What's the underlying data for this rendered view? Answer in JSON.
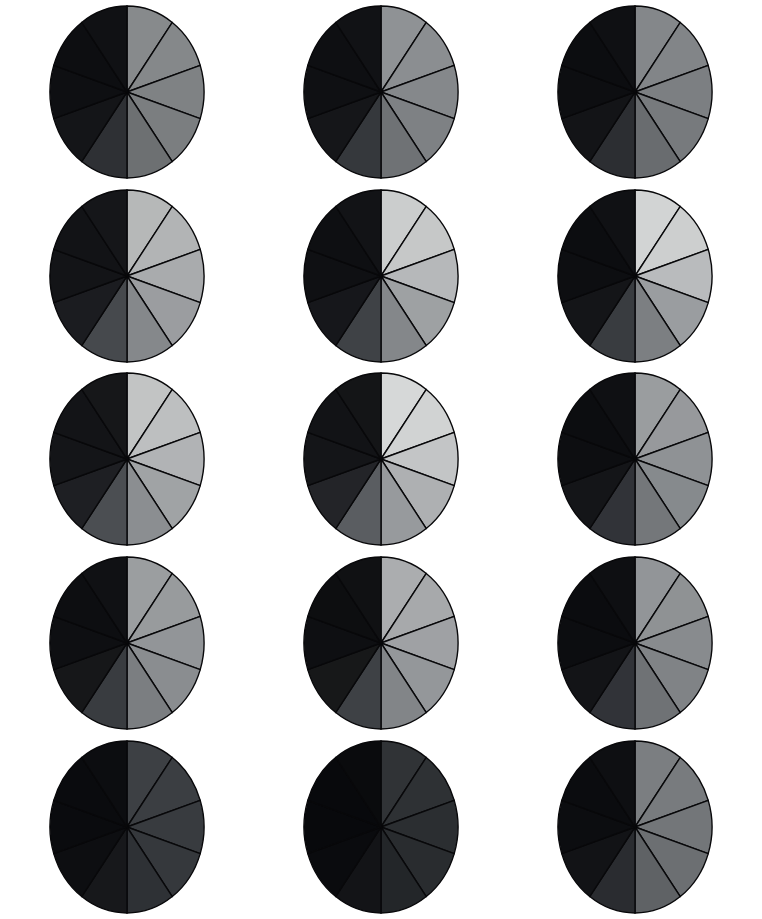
{
  "figure": {
    "title": "",
    "background_color": "#ffffff",
    "width": 762,
    "height": 919,
    "rows": 5,
    "cols": 3,
    "pie_radius_x": 77,
    "pie_radius_y": 86,
    "wedge_outline_color": "#08080a"
  },
  "chart_data": {
    "type": "pie",
    "title": "",
    "subtitle": "",
    "xlabel": "",
    "ylabel": "",
    "legend": [],
    "annotations": [],
    "grid": false,
    "n_charts": 15,
    "slices_per_chart": 10,
    "categories": [
      "s1",
      "s2",
      "s3",
      "s4",
      "s5",
      "s6",
      "s7",
      "s8",
      "s9",
      "s10"
    ],
    "values": [
      10,
      10,
      10,
      10,
      10,
      10,
      10,
      10,
      10,
      10
    ],
    "slice_angle_deg": 36,
    "start_angle_deg": 0,
    "charts": [
      {
        "id": "r1c1",
        "row": 1,
        "col": 1,
        "values": [
          10,
          10,
          10,
          10,
          10,
          10,
          10,
          10,
          10,
          10
        ],
        "colors": [
          "#878a8c",
          "#85888a",
          "#7f8284",
          "#7b7e80",
          "#6d7072",
          "#2e3034",
          "#141518",
          "#0e0f12",
          "#0d0e11",
          "#101114"
        ]
      },
      {
        "id": "r1c2",
        "row": 1,
        "col": 2,
        "values": [
          10,
          10,
          10,
          10,
          10,
          10,
          10,
          10,
          10,
          10
        ],
        "colors": [
          "#8f9295",
          "#8b8e91",
          "#85888b",
          "#7e8184",
          "#6f7275",
          "#35383c",
          "#151619",
          "#0f1013",
          "#0e0f12",
          "#111215"
        ]
      },
      {
        "id": "r1c3",
        "row": 1,
        "col": 3,
        "values": [
          10,
          10,
          10,
          10,
          10,
          10,
          10,
          10,
          10,
          10
        ],
        "colors": [
          "#84878a",
          "#828588",
          "#7c7f82",
          "#777a7d",
          "#696c6f",
          "#2c2e32",
          "#131417",
          "#0d0e11",
          "#0c0d10",
          "#0f1013"
        ]
      },
      {
        "id": "r2c1",
        "row": 2,
        "col": 1,
        "values": [
          10,
          10,
          10,
          10,
          10,
          10,
          10,
          10,
          10,
          10
        ],
        "colors": [
          "#b6b8b8",
          "#b2b4b5",
          "#a9abad",
          "#9b9da0",
          "#85888b",
          "#46494d",
          "#1b1c20",
          "#131417",
          "#121316",
          "#151619"
        ]
      },
      {
        "id": "r2c2",
        "row": 2,
        "col": 2,
        "values": [
          10,
          10,
          10,
          10,
          10,
          10,
          10,
          10,
          10,
          10
        ],
        "colors": [
          "#cbcdcd",
          "#c6c8c8",
          "#b6b8ba",
          "#9ea1a3",
          "#84878a",
          "#3f4246",
          "#16171b",
          "#0f1013",
          "#0e0f12",
          "#121316"
        ]
      },
      {
        "id": "r2c3",
        "row": 2,
        "col": 3,
        "values": [
          10,
          10,
          10,
          10,
          10,
          10,
          10,
          10,
          10,
          10
        ],
        "colors": [
          "#d2d4d4",
          "#cdcfcf",
          "#b9bbbd",
          "#9a9da0",
          "#7c7f82",
          "#393c40",
          "#141518",
          "#0d0e11",
          "#0c0d10",
          "#101114"
        ]
      },
      {
        "id": "r3c1",
        "row": 3,
        "col": 1,
        "values": [
          10,
          10,
          10,
          10,
          10,
          10,
          10,
          10,
          10,
          10
        ],
        "colors": [
          "#c2c4c4",
          "#bdbfc0",
          "#b1b3b5",
          "#a0a3a5",
          "#8b8e91",
          "#4b4e52",
          "#1e1f23",
          "#141518",
          "#131417",
          "#161719"
        ]
      },
      {
        "id": "r3c2",
        "row": 3,
        "col": 2,
        "values": [
          10,
          10,
          10,
          10,
          10,
          10,
          10,
          10,
          10,
          10
        ],
        "colors": [
          "#d6d8d8",
          "#d1d3d3",
          "#c3c5c6",
          "#aeb0b2",
          "#979a9d",
          "#5a5d61",
          "#232428",
          "#141518",
          "#121316",
          "#141517"
        ]
      },
      {
        "id": "r3c3",
        "row": 3,
        "col": 3,
        "values": [
          10,
          10,
          10,
          10,
          10,
          10,
          10,
          10,
          10,
          10
        ],
        "colors": [
          "#9a9d9f",
          "#97999c",
          "#8f9295",
          "#868a8d",
          "#74777a",
          "#313338",
          "#141518",
          "#0d0e11",
          "#0c0d10",
          "#0f1013"
        ]
      },
      {
        "id": "r4c1",
        "row": 4,
        "col": 1,
        "values": [
          10,
          10,
          10,
          10,
          10,
          10,
          10,
          10,
          10,
          10
        ],
        "colors": [
          "#9b9ea0",
          "#989b9d",
          "#929598",
          "#8a8d90",
          "#7b7e81",
          "#393c40",
          "#161719",
          "#0e0f12",
          "#0d0e11",
          "#101114"
        ]
      },
      {
        "id": "r4c2",
        "row": 4,
        "col": 2,
        "values": [
          10,
          10,
          10,
          10,
          10,
          10,
          10,
          10,
          10,
          10
        ],
        "colors": [
          "#abadaf",
          "#a7a9ab",
          "#9fa1a4",
          "#94979a",
          "#828588",
          "#3e4145",
          "#171819",
          "#0e0f12",
          "#0d0e10",
          "#101113"
        ]
      },
      {
        "id": "r4c3",
        "row": 4,
        "col": 3,
        "values": [
          10,
          10,
          10,
          10,
          10,
          10,
          10,
          10,
          10,
          10
        ],
        "colors": [
          "#929598",
          "#8f9294",
          "#888b8e",
          "#808386",
          "#6f7275",
          "#313338",
          "#131417",
          "#0c0d10",
          "#0b0c0f",
          "#0e0f12"
        ]
      },
      {
        "id": "r5c1",
        "row": 5,
        "col": 1,
        "values": [
          10,
          10,
          10,
          10,
          10,
          10,
          10,
          10,
          10,
          10
        ],
        "colors": [
          "#3d4044",
          "#3b3e42",
          "#383b3f",
          "#35383c",
          "#2e3135",
          "#17181b",
          "#0d0e11",
          "#0a0b0e",
          "#0a0b0e",
          "#0c0d10"
        ]
      },
      {
        "id": "r5c2",
        "row": 5,
        "col": 2,
        "values": [
          10,
          10,
          10,
          10,
          10,
          10,
          10,
          10,
          10,
          10
        ],
        "colors": [
          "#303336",
          "#2e3134",
          "#2b2e31",
          "#292c2f",
          "#232629",
          "#131417",
          "#0a0b0e",
          "#08090c",
          "#08090c",
          "#0a0b0d"
        ]
      },
      {
        "id": "r5c3",
        "row": 5,
        "col": 3,
        "values": [
          10,
          10,
          10,
          10,
          10,
          10,
          10,
          10,
          10,
          10
        ],
        "colors": [
          "#7b7e81",
          "#787b7e",
          "#737679",
          "#6c6f72",
          "#5f6265",
          "#2a2c30",
          "#121316",
          "#0c0d10",
          "#0b0c0f",
          "#0e0f12"
        ]
      }
    ]
  }
}
